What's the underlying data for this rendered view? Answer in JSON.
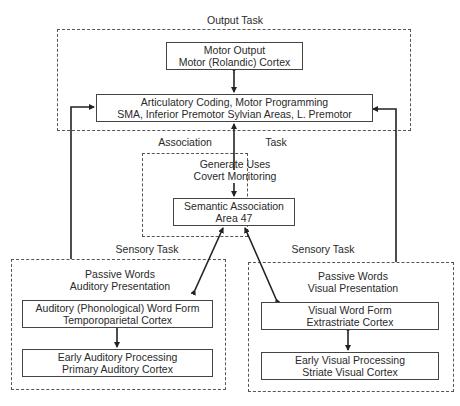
{
  "diagram": {
    "output_task": {
      "label": "Output Task",
      "motor_output": {
        "line1": "Motor Output",
        "line2": "Motor (Rolandic) Cortex"
      },
      "articulatory": {
        "line1": "Articulatory Coding, Motor Programming",
        "line2": "SMA, Inferior Premotor Sylvian Areas, L. Premotor"
      }
    },
    "association_task": {
      "label_left": "Association",
      "label_right": "Task",
      "generate": {
        "line1": "Generate Uses",
        "line2": "Covert Monitoring"
      },
      "semantic": {
        "line1": "Semantic Association",
        "line2": "Area 47"
      }
    },
    "sensory_auditory": {
      "label": "Sensory Task",
      "title": {
        "line1": "Passive Words",
        "line2": "Auditory Presentation"
      },
      "word_form": {
        "line1": "Auditory (Phonological) Word Form",
        "line2": "Temporoparietal Cortex"
      },
      "early": {
        "line1": "Early Auditory Processing",
        "line2": "Primary Auditory Cortex"
      }
    },
    "sensory_visual": {
      "label": "Sensory Task",
      "title": {
        "line1": "Passive Words",
        "line2": "Visual Presentation"
      },
      "word_form": {
        "line1": "Visual Word Form",
        "line2": "Extrastriate Cortex"
      },
      "early": {
        "line1": "Early Visual Processing",
        "line2": "Striate Visual Cortex"
      }
    },
    "connections": [
      {
        "from": "motor-output",
        "to": "articulatory",
        "type": "bidirectional"
      },
      {
        "from": "generate-uses",
        "to": "articulatory",
        "type": "directed"
      },
      {
        "from": "generate-uses",
        "to": "semantic-association",
        "type": "directed"
      },
      {
        "from": "auditory-word-form",
        "to": "semantic-association",
        "type": "bidirectional"
      },
      {
        "from": "visual-word-form",
        "to": "semantic-association",
        "type": "bidirectional"
      },
      {
        "from": "auditory-word-form",
        "to": "early-auditory",
        "type": "bidirectional"
      },
      {
        "from": "visual-word-form",
        "to": "early-visual",
        "type": "bidirectional"
      },
      {
        "from": "sensory-auditory-group",
        "to": "articulatory",
        "type": "directed"
      },
      {
        "from": "sensory-visual-group",
        "to": "articulatory",
        "type": "directed"
      }
    ]
  }
}
